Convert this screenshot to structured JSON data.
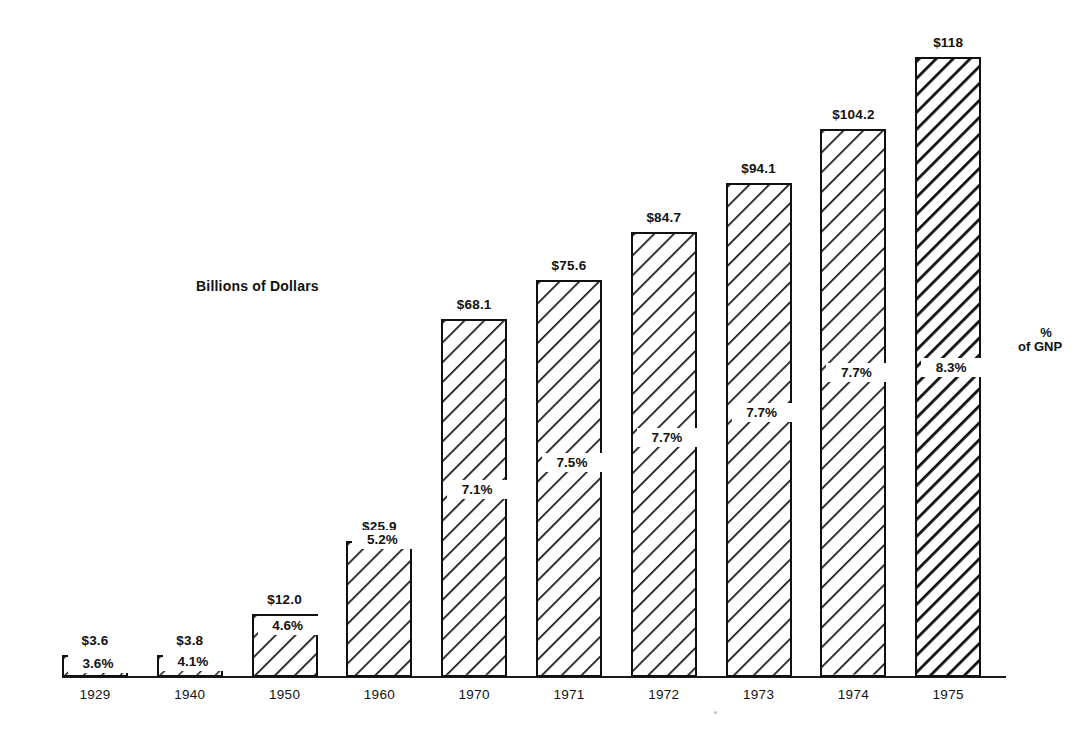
{
  "chart_data": {
    "type": "bar",
    "title": "",
    "subtitle": "",
    "xlabel": "",
    "ylabel": "Billions of Dollars",
    "axis_title_inside": "Billions of Dollars",
    "grid": false,
    "legend": "none",
    "ylim": [
      0,
      125
    ],
    "categories": [
      "1929",
      "1940",
      "1950",
      "1960",
      "1970",
      "1971",
      "1972",
      "1973",
      "1974",
      "1975"
    ],
    "values": [
      3.6,
      3.8,
      12.0,
      25.9,
      68.1,
      75.6,
      84.7,
      94.1,
      104.2,
      118
    ],
    "value_labels": [
      "$3.6",
      "$3.8",
      "$12.0",
      "$25.9",
      "$68.1",
      "$75.6",
      "$84.7",
      "$94.1",
      "$104.2",
      "$118"
    ],
    "series": [
      {
        "name": "Billions of Dollars",
        "values": [
          3.6,
          3.8,
          12.0,
          25.9,
          68.1,
          75.6,
          84.7,
          94.1,
          104.2,
          118
        ]
      },
      {
        "name": "% of GNP",
        "values": [
          3.6,
          4.1,
          4.6,
          5.2,
          7.1,
          7.5,
          7.7,
          7.7,
          7.7,
          8.3
        ]
      }
    ],
    "percent_labels": [
      "3.6%",
      "4.1%",
      "4.6%",
      "5.2%",
      "7.1%",
      "7.5%",
      "7.7%",
      "7.7%",
      "7.7%",
      "8.3%"
    ],
    "annotations": {
      "right_percent_symbol": "%",
      "right_of_gnp": "of GNP"
    },
    "colors": {
      "bar_outline": "#111111",
      "bar_fill": "#ffffff",
      "hatch": "#111111",
      "text": "#111111",
      "background": "#ffffff"
    }
  },
  "bars": [
    {
      "year": "1929",
      "value_label": "$3.6",
      "pct_label": "3.6%",
      "value": 3.6,
      "hatch": "sparse"
    },
    {
      "year": "1940",
      "value_label": "$3.8",
      "pct_label": "4.1%",
      "value": 3.8,
      "hatch": "sparse"
    },
    {
      "year": "1950",
      "value_label": "$12.0",
      "pct_label": "4.6%",
      "value": 12.0,
      "hatch": "normal"
    },
    {
      "year": "1960",
      "value_label": "$25.9",
      "pct_label": "5.2%",
      "value": 25.9,
      "hatch": "normal"
    },
    {
      "year": "1970",
      "value_label": "$68.1",
      "pct_label": "7.1%",
      "value": 68.1,
      "hatch": "normal"
    },
    {
      "year": "1971",
      "value_label": "$75.6",
      "pct_label": "7.5%",
      "value": 75.6,
      "hatch": "normal"
    },
    {
      "year": "1972",
      "value_label": "$84.7",
      "pct_label": "7.7%",
      "value": 84.7,
      "hatch": "normal"
    },
    {
      "year": "1973",
      "value_label": "$94.1",
      "pct_label": "7.7%",
      "value": 94.1,
      "hatch": "normal"
    },
    {
      "year": "1974",
      "value_label": "$104.2",
      "pct_label": "7.7%",
      "value": 104.2,
      "hatch": "normal"
    },
    {
      "year": "1975",
      "value_label": "$118",
      "pct_label": "8.3%",
      "value": 118,
      "hatch": "dense"
    }
  ],
  "axis_title": "Billions of Dollars",
  "gnp": {
    "symbol": "%",
    "text": "of GNP"
  }
}
